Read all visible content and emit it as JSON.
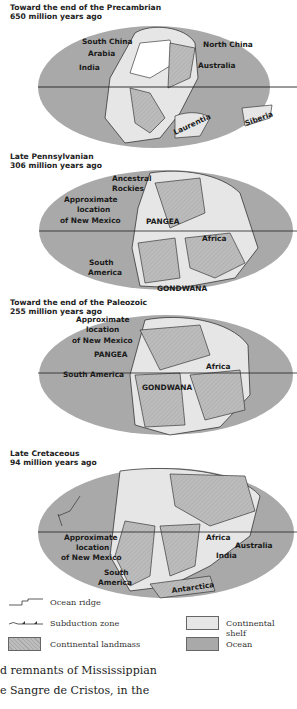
{
  "maps": [
    {
      "title_line1": "Toward the end of the Precambrian",
      "title_line2": "650 million years ago",
      "labels": [
        "South China",
        "Arabia",
        "India",
        "North China",
        "Australia",
        "Laurentia",
        "Siberia"
      ]
    },
    {
      "title_line1": "Late Pennsylvanian",
      "title_line2": "306 million years ago",
      "labels": [
        "Ancestral",
        "Rockies",
        "Approximate",
        "location",
        "of New Mexico",
        "PANGEA",
        "Africa",
        "South",
        "America",
        "GONDWANA"
      ]
    },
    {
      "title_line1": "Toward the end of the Paleozoic",
      "title_line2": "255 million years ago",
      "labels": [
        "Approximate",
        "location",
        "of New Mexico",
        "PANGEA",
        "South America",
        "Africa",
        "GONDWANA"
      ]
    },
    {
      "title_line1": "Late Cretaceous",
      "title_line2": "94 million years ago",
      "labels": [
        "Approximate",
        "location",
        "of New Mexico",
        "South",
        "America",
        "Africa",
        "India",
        "Australia",
        "Antarctica"
      ]
    }
  ],
  "legend": {
    "ocean_ridge": "Ocean ridge",
    "subduction_zone": "Subduction zone",
    "continental_landmass": "Continental landmass",
    "continental_shelf": "Continental shelf",
    "ocean": "Ocean"
  },
  "colors": {
    "ocean": "#a9a9a9",
    "shelf": "#e6e6e6",
    "landmass": "#b9b9b9",
    "outline": "#222222"
  },
  "body_text": {
    "line1": "d remnants of Mississippian",
    "line2": "e Sangre de Cristos, in the"
  }
}
